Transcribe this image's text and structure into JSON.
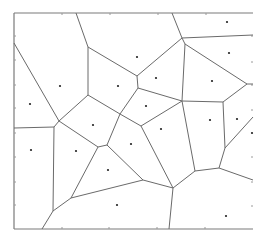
{
  "diagram": {
    "type": "voronoi",
    "plot_area": {
      "x0": 14,
      "y0": 13,
      "x1": 253,
      "y1": 229
    },
    "colors": {
      "edge": "#6a6a6a",
      "border": "#7a7a7a",
      "site": "#222222",
      "tick": "#9a9a9a",
      "background": "#ffffff"
    },
    "borders": [
      [
        14,
        13,
        253,
        13
      ],
      [
        14,
        13,
        14,
        229
      ],
      [
        14,
        229,
        253,
        229
      ]
    ],
    "ticks": {
      "top_x": [
        62,
        110,
        158,
        206
      ],
      "bottom_x": [
        62,
        109,
        157,
        205
      ],
      "left_y": [
        36,
        60,
        85,
        108,
        133,
        157,
        182,
        205
      ],
      "right_y": [
        36,
        62,
        85,
        110,
        157,
        182,
        206
      ]
    },
    "edges": [
      [
        76,
        13,
        88,
        47
      ],
      [
        88,
        47,
        88,
        95
      ],
      [
        14,
        43,
        59,
        121
      ],
      [
        88,
        47,
        137,
        76
      ],
      [
        137,
        76,
        182,
        38
      ],
      [
        172,
        13,
        182,
        38
      ],
      [
        182,
        38,
        253,
        35
      ],
      [
        182,
        38,
        185,
        44
      ],
      [
        185,
        44,
        247,
        84
      ],
      [
        247,
        84,
        253,
        84
      ],
      [
        185,
        44,
        182,
        101
      ],
      [
        137,
        76,
        138,
        88
      ],
      [
        138,
        88,
        182,
        101
      ],
      [
        138,
        88,
        120,
        114
      ],
      [
        88,
        95,
        120,
        114
      ],
      [
        88,
        95,
        59,
        121
      ],
      [
        59,
        121,
        54,
        127
      ],
      [
        14,
        128,
        54,
        127
      ],
      [
        54,
        127,
        53,
        211
      ],
      [
        53,
        211,
        42,
        229
      ],
      [
        53,
        211,
        71,
        198
      ],
      [
        59,
        121,
        98,
        147
      ],
      [
        98,
        147,
        107,
        145
      ],
      [
        107,
        145,
        120,
        114
      ],
      [
        98,
        147,
        71,
        198
      ],
      [
        107,
        145,
        143,
        180
      ],
      [
        71,
        198,
        143,
        180
      ],
      [
        120,
        114,
        141,
        126
      ],
      [
        141,
        126,
        182,
        101
      ],
      [
        141,
        126,
        173,
        188
      ],
      [
        143,
        180,
        173,
        188
      ],
      [
        173,
        188,
        169,
        229
      ],
      [
        173,
        188,
        195,
        171
      ],
      [
        182,
        101,
        195,
        171
      ],
      [
        182,
        101,
        223,
        102
      ],
      [
        223,
        102,
        247,
        84
      ],
      [
        223,
        102,
        225,
        148
      ],
      [
        225,
        148,
        253,
        117
      ],
      [
        225,
        148,
        219,
        168
      ],
      [
        195,
        171,
        219,
        168
      ],
      [
        219,
        168,
        253,
        180
      ]
    ],
    "sites": [
      [
        30,
        104
      ],
      [
        60,
        86
      ],
      [
        137,
        57
      ],
      [
        227,
        22
      ],
      [
        229,
        53
      ],
      [
        156,
        78
      ],
      [
        118,
        86
      ],
      [
        212,
        81
      ],
      [
        93,
        125
      ],
      [
        146,
        106
      ],
      [
        161,
        129
      ],
      [
        210,
        120
      ],
      [
        237,
        119
      ],
      [
        252,
        133
      ],
      [
        31,
        150
      ],
      [
        76,
        151
      ],
      [
        131,
        144
      ],
      [
        108,
        170
      ],
      [
        117,
        205
      ],
      [
        226,
        216
      ]
    ]
  }
}
